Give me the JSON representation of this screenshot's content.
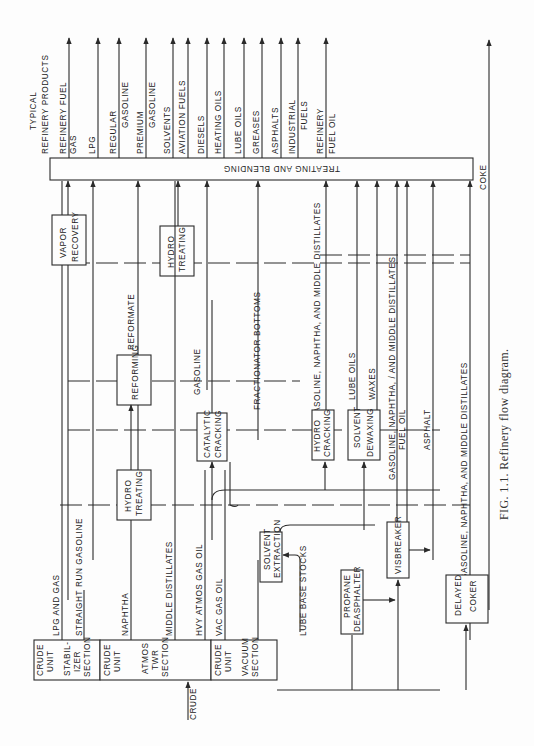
{
  "header": {
    "title_line1": "TYPICAL",
    "title_line2": "REFINERY PRODUCTS"
  },
  "caption": "FIG. 1.1.   Refinery flow diagram.",
  "products": [
    {
      "l1": "REFINERY FUEL",
      "l2": "GAS"
    },
    {
      "l1": "LPG",
      "l2": ""
    },
    {
      "l1": "REGULAR",
      "l2": "GASOLINE"
    },
    {
      "l1": "PREMIUM",
      "l2": "GASOLINE"
    },
    {
      "l1": "SOLVENTS",
      "l2": ""
    },
    {
      "l1": "AVIATION FUELS",
      "l2": ""
    },
    {
      "l1": "DIESELS",
      "l2": ""
    },
    {
      "l1": "HEATING OILS",
      "l2": ""
    },
    {
      "l1": "LUBE OILS",
      "l2": ""
    },
    {
      "l1": "GREASES",
      "l2": ""
    },
    {
      "l1": "ASPHALTS",
      "l2": ""
    },
    {
      "l1": "INDUSTRIAL",
      "l2": "FUELS"
    },
    {
      "l1": "REFINERY",
      "l2": "FUEL OIL"
    }
  ],
  "coke": "COKE",
  "blending": "TREATING   AND   BLENDING",
  "crude_feed": "CRUDE",
  "units": {
    "stabilizer": {
      "l1": "CRUDE",
      "l2": "UNIT",
      "l3": "STABIL-",
      "l4": "IZER",
      "l5": "SECTION"
    },
    "atmos": {
      "l1": "CRUDE",
      "l2": "UNIT",
      "l3": "ATMOS",
      "l4": "TWR",
      "l5": "SECTION"
    },
    "vacuum": {
      "l1": "CRUDE",
      "l2": "UNIT",
      "l3": "VACUUM",
      "l4": "SECTION"
    },
    "vapor_recovery": {
      "l1": "VAPOR",
      "l2": "RECOVERY"
    },
    "reforming": {
      "l1": "REFORMING"
    },
    "hydro_treating_1": {
      "l1": "HYDRO",
      "l2": "TREATING"
    },
    "hydro_treating_2": {
      "l1": "HYDRO",
      "l2": "TREATING"
    },
    "catalytic_cracking": {
      "l1": "CATALYTIC",
      "l2": "CRACKING"
    },
    "hydro_cracking": {
      "l1": "HYDRO",
      "l2": "CRACKING"
    },
    "solvent_dewaxing": {
      "l1": "SOLVENT",
      "l2": "DEWAXING"
    },
    "solvent_extraction": {
      "l1": "SOLVENT",
      "l2": "EXTRACTION"
    },
    "propane_deasphalter": {
      "l1": "PROPANE",
      "l2": "DEASPHALTER"
    },
    "visbreaker": {
      "l1": "VISBREAKER"
    },
    "delayed_coker": {
      "l1": "DELAYED",
      "l2": "COKER"
    }
  },
  "streams": {
    "lpg_gas": "LPG AND GAS",
    "srg": "STRAIGHT RUN GASOLINE",
    "naphtha": "NAPHTHA",
    "middle_dist": "MIDDLE DISTILLATES",
    "hvy_atmos": "HVY ATMOS GAS OIL",
    "vac_gas_oil": "VAC GAS OIL",
    "lube_base": "LUBE BASE STOCKS",
    "reformate": "REFORMATE",
    "gasoline": "GASOLINE",
    "frac_bottoms": "FRACTIONATOR BOTTOMS",
    "hc_products": "GASOLINE, NAPHTHA, AND MIDDLE DISTILLATES",
    "lube_oils": "LUBE OILS",
    "waxes": "WAXES",
    "vb_products": "GASOLINE, NAPHTHA, / AND MIDDLE DISTILLATES",
    "fuel_oil": "FUEL OIL",
    "asphalt": "ASPHALT",
    "coker_products": "GASOLINE, NAPHTHA, AND MIDDLE DISTILLATES"
  }
}
